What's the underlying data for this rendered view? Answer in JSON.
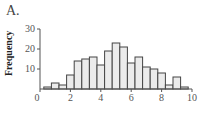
{
  "panel_label": "A.",
  "chart_data": {
    "type": "bar",
    "title": "",
    "xlabel": "",
    "ylabel": "Frequency",
    "xlim": [
      0,
      10
    ],
    "ylim": [
      0,
      30
    ],
    "xticks": [
      0,
      2,
      4,
      6,
      8,
      10
    ],
    "yticks": [
      10,
      20,
      30
    ],
    "bin_width": 0.5,
    "bin_starts": [
      0.25,
      0.75,
      1.25,
      1.75,
      2.25,
      2.75,
      3.25,
      3.75,
      4.25,
      4.75,
      5.25,
      5.75,
      6.25,
      6.75,
      7.25,
      7.75,
      8.25,
      8.75,
      9.25
    ],
    "values": [
      1,
      3,
      2,
      7,
      14,
      15,
      16,
      12,
      19,
      23,
      21,
      13,
      16,
      11,
      10,
      8,
      2,
      6,
      1
    ],
    "grid": false,
    "legend": null,
    "bar_fill": "#ebebeb",
    "bar_stroke": "#444444"
  }
}
